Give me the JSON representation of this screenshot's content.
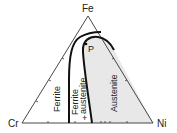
{
  "diagram": {
    "type": "ternary-phase-diagram",
    "vertices": {
      "top": "Fe",
      "left": "Cr",
      "right": "Ni"
    },
    "regions": [
      {
        "name": "ferrite",
        "label": "Ferrite"
      },
      {
        "name": "ferrite-austenite",
        "label_line1": "Ferrite",
        "label_line2": "austenite"
      },
      {
        "name": "austenite",
        "label": "Austenite",
        "shaded": true
      }
    ],
    "point": {
      "label": "P"
    },
    "marker": {
      "label": "+"
    },
    "colors": {
      "lines": "#222222",
      "austenite_fill": "#e4e4e4",
      "background": "#ffffff"
    }
  }
}
